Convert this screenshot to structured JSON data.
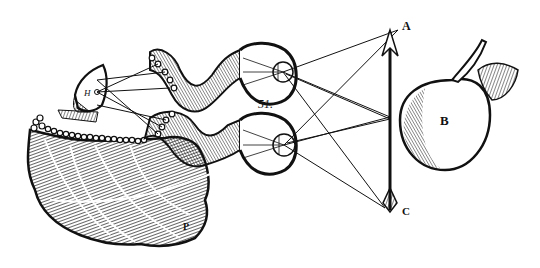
{
  "figure": {
    "number_label": "51.",
    "style": "woodcut engraving",
    "ink_color": "#111111",
    "paper_color": "#ffffff",
    "labels": {
      "arrow_tip": "A",
      "apple": "B",
      "arrow_tail": "C",
      "pineal_gland": "H",
      "brain_mark": "P",
      "gland_points": [
        "a",
        "b",
        "c"
      ],
      "nerve_points_upper": [
        "6",
        "4",
        "2"
      ],
      "nerve_points_lower": [
        "6",
        "4",
        "3"
      ],
      "eye_points": [
        "1",
        "3",
        "5"
      ],
      "lower_brain_mark": "8"
    }
  }
}
